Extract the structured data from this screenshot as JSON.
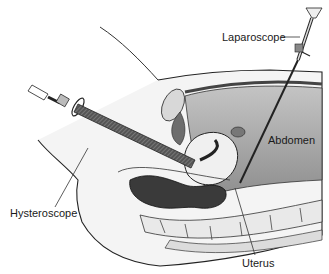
{
  "figure": {
    "labels": {
      "laparoscope": "Laparoscope",
      "abdomen": "Abdomen",
      "hysteroscope": "Hysteroscope",
      "uterus": "Uterus"
    },
    "colors": {
      "background": "#ffffff",
      "outline": "#222222",
      "abdomen_fill": "#a9a9a9",
      "dark_organ": "#3a3a3a",
      "skin": "#f2f2f2",
      "spine": "#e6e6e6"
    }
  }
}
